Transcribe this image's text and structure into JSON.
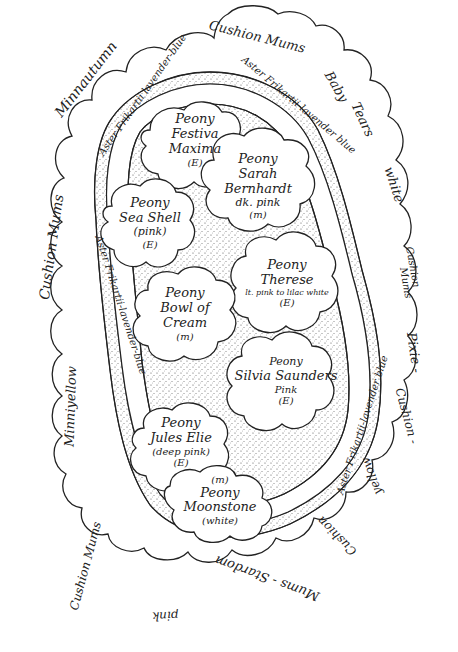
{
  "diagram": {
    "type": "garden-bed-plan",
    "shape": "kidney/ear-shaped bed with concentric planting rings"
  },
  "outer_ring": {
    "name": "border plantings",
    "labels": [
      {
        "id": "cushion-mums-top",
        "text": "Cushion Mums"
      },
      {
        "id": "baby-tears",
        "text_a": "Baby",
        "text_b": "Tears"
      },
      {
        "id": "white",
        "text": "white"
      },
      {
        "id": "cushion-mums-right",
        "text_a": "Cushion",
        "text_b": "Mums"
      },
      {
        "id": "pixie",
        "text": "Pixie -"
      },
      {
        "id": "cushion-right-lower",
        "text": "Cushion -"
      },
      {
        "id": "yellow",
        "text": "yellow"
      },
      {
        "id": "cushion-mums-stardom",
        "text_a": "Cushion",
        "text_b": "Mums - Stardom"
      },
      {
        "id": "pink",
        "text": "pink"
      },
      {
        "id": "cushion-mums-left-lower",
        "text": "Cushion Mums"
      },
      {
        "id": "minniyellow",
        "text": "Minniyellow"
      },
      {
        "id": "cushion-mums-left",
        "text": "Cushion Mums"
      },
      {
        "id": "minnautumn",
        "text": "Minnautumn"
      }
    ]
  },
  "middle_ring": {
    "name": "aster ring",
    "labels": [
      {
        "id": "aster-top-left",
        "text": "Aster Frikartii lavender-blue"
      },
      {
        "id": "aster-top-right",
        "text": "Aster Frikartii-lavender blue"
      },
      {
        "id": "aster-left",
        "text": "Aster Frikartii-lavender-blue"
      },
      {
        "id": "aster-right",
        "text": "Aster Frikartii-lavender blue"
      }
    ]
  },
  "peonies": [
    {
      "name1": "Peony",
      "name2": "Festiva",
      "name3": "Maxima",
      "note": "(E)"
    },
    {
      "name1": "Peony",
      "name2": "Sarah",
      "name3": "Bernhardt",
      "color": "dk. pink",
      "note": "(m)"
    },
    {
      "name1": "Peony",
      "name2": "Sea Shell",
      "color": "(pink)",
      "note": "(E)"
    },
    {
      "name1": "Peony",
      "name2": "Therese",
      "color": "lt. pink to lilac white",
      "note": "(E)"
    },
    {
      "name1": "Peony",
      "name2": "Bowl of",
      "name3": "Cream",
      "note": "(m)"
    },
    {
      "name1": "Peony",
      "name2": "Silvia Saunders",
      "color": "Pink",
      "note": "(E)"
    },
    {
      "name1": "Peony",
      "name2": "Jules Elie",
      "color": "(deep pink)",
      "note": "(E)"
    },
    {
      "name1": "Peony",
      "name2": "Moonstone",
      "color": "(white)",
      "note": "(m)"
    }
  ],
  "colors": {
    "ink": "#222222",
    "paper": "#ffffff",
    "stipple": "#555555"
  }
}
